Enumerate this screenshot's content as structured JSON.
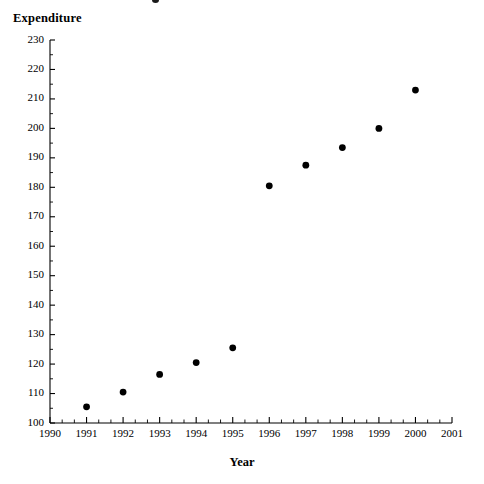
{
  "chart_data": {
    "type": "scatter",
    "title": "",
    "xlabel": "Year",
    "ylabel": "Expenditure",
    "x": [
      1991,
      1992,
      1993,
      1994,
      1995,
      1996,
      1997,
      1998,
      1999,
      2000
    ],
    "values": [
      105.5,
      110.5,
      116.5,
      120.5,
      125.5,
      180.5,
      187.5,
      193.5,
      200.0,
      213.0
    ],
    "series": [
      {
        "name": "Expenditure",
        "points": [
          {
            "x": 1991,
            "y": 105.5
          },
          {
            "x": 1992,
            "y": 110.5
          },
          {
            "x": 1993,
            "y": 116.5
          },
          {
            "x": 1994,
            "y": 120.5
          },
          {
            "x": 1995,
            "y": 125.5
          },
          {
            "x": 1996,
            "y": 180.5
          },
          {
            "x": 1997,
            "y": 187.5
          },
          {
            "x": 1998,
            "y": 193.5
          },
          {
            "x": 1999,
            "y": 200.0
          },
          {
            "x": 2000,
            "y": 213.0
          }
        ]
      }
    ],
    "xlim": [
      1990,
      2001
    ],
    "ylim": [
      100,
      230
    ],
    "y_tick_labels": [
      "230",
      "220",
      "210",
      "200",
      "190",
      "180",
      "170",
      "160",
      "150",
      "140",
      "130",
      "120",
      "110",
      "100"
    ],
    "y_ticks": [
      230,
      220,
      210,
      200,
      190,
      180,
      170,
      160,
      150,
      140,
      130,
      120,
      110,
      100
    ],
    "y_minor_interval": 5,
    "x_tick_labels": [
      "1990",
      "1991",
      "1992",
      "1993",
      "1994",
      "1995",
      "1996",
      "1997",
      "1998",
      "1999",
      "2000",
      "2001"
    ],
    "x_ticks": [
      1990,
      1991,
      1992,
      1993,
      1994,
      1995,
      1996,
      1997,
      1998,
      1999,
      2000,
      2001
    ],
    "x_minor_divisions": 3,
    "grid": false,
    "legend": false,
    "marker_color": "#000000",
    "axis_color": "#000000",
    "background_color": "#ffffff"
  }
}
